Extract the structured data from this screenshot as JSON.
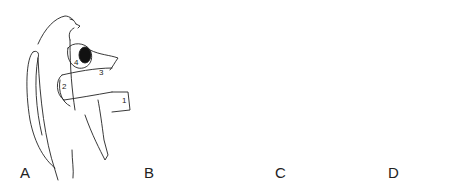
{
  "figure": {
    "panels": [
      {
        "label": "A",
        "step_numbers": [
          "1",
          "2",
          "3",
          "4"
        ],
        "content": "Bandage wrapped around the wing in a figure-eight pattern with numbered arrows indicating wrap direction"
      },
      {
        "label": "B",
        "step_numbers": [],
        "content": "Bandage roll with wrap layers over folded wing, dashed lines showing underlying wraps"
      },
      {
        "label": "C",
        "step_numbers": [],
        "content": "Bandage roll passing behind the body with dashed lines to the wing wrap"
      },
      {
        "label": "D",
        "step_numbers": [],
        "content": "Completed body wrap securing the wing against the body"
      }
    ]
  },
  "colors": {
    "line": "#222222",
    "background": "#ffffff",
    "roll_fill": "#111111"
  }
}
